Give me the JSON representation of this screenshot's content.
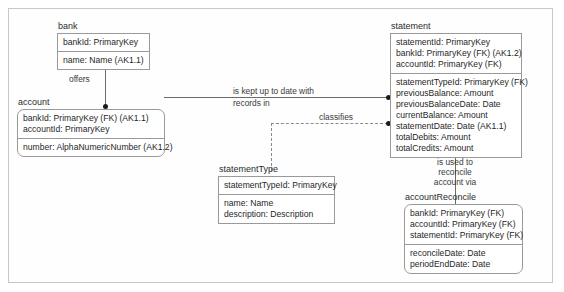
{
  "diagram": {
    "type": "entity-relationship-diagram",
    "entities": [
      {
        "id": "bank",
        "name": "bank",
        "key_attributes": [
          "bankId: PrimaryKey"
        ],
        "attributes": [
          "name: Name (AK1.1)"
        ]
      },
      {
        "id": "account",
        "name": "account",
        "key_attributes": [
          "bankId: PrimaryKey (FK) (AK1.1)",
          "accountId: PrimaryKey"
        ],
        "attributes": [
          "number: AlphaNumericNumber (AK1.2)"
        ]
      },
      {
        "id": "statement",
        "name": "statement",
        "key_attributes": [
          "statementId: PrimaryKey",
          "bankId: PrimaryKey (FK) (AK1.2)",
          "accountId: PrimaryKey (FK)"
        ],
        "attributes": [
          "statementTypeId: PrimaryKey (FK)",
          "previousBalance: Amount",
          "previousBalanceDate: Date",
          "currentBalance: Amount",
          "statementDate: Date (AK1.1)",
          "totalDebits: Amount",
          "totalCredits: Amount"
        ]
      },
      {
        "id": "statementType",
        "name": "statementType",
        "key_attributes": [
          "statementTypeId: PrimaryKey"
        ],
        "attributes": [
          "name: Name",
          "description: Description"
        ]
      },
      {
        "id": "accountReconcile",
        "name": "accountReconcile",
        "key_attributes": [
          "bankId: PrimaryKey (FK)",
          "accountId: PrimaryKey (FK)",
          "statementId: PrimaryKey (FK)"
        ],
        "attributes": [
          "reconcileDate: Date",
          "periodEndDate: Date"
        ]
      }
    ],
    "relationships": [
      {
        "id": "bank-account",
        "label": "offers",
        "from": "bank",
        "to": "account",
        "style": "solid"
      },
      {
        "id": "account-statement",
        "label_line1": "is kept up to date with",
        "label_line2": "records in",
        "from": "account",
        "to": "statement",
        "style": "solid"
      },
      {
        "id": "statementtype-statement",
        "label": "classifies",
        "from": "statementType",
        "to": "statement",
        "style": "dashed"
      },
      {
        "id": "statement-accountreconcile",
        "label_line1": "is used to",
        "label_line2": "reconcile",
        "label_line3": "account via",
        "from": "statement",
        "to": "accountReconcile",
        "style": "solid"
      }
    ]
  }
}
